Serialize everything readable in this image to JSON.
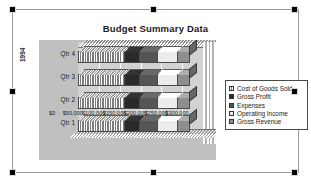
{
  "object": {
    "type": "embedded-chart-object",
    "selected": true,
    "handle_count": 8
  },
  "chart_data": {
    "type": "bar",
    "subtype": "3d-stacked-horizontal-bar",
    "title": "Budget Summary Data",
    "xlabel": "",
    "ylabel": "1994",
    "categories": [
      "Qtr 4",
      "Qtr 3",
      "Qtr 2",
      "Qtr 1"
    ],
    "series": [
      {
        "name": "Cost of Goods Sold",
        "color": "#7d7d7d",
        "pattern": "vertical-stripes",
        "values": [
          112000,
          112000,
          112000,
          112000
        ]
      },
      {
        "name": "Gross Profit",
        "color": "#2a2a2a",
        "pattern": "solid-dark",
        "values": [
          38000,
          38000,
          38000,
          38000
        ]
      },
      {
        "name": "Expenses",
        "color": "#555555",
        "pattern": "solid-medium",
        "values": [
          42000,
          42000,
          42000,
          42000
        ]
      },
      {
        "name": "Operating Income",
        "color": "#ececec",
        "pattern": "solid-light",
        "values": [
          48000,
          48000,
          48000,
          48000
        ]
      },
      {
        "name": "Gross Revenue",
        "color": "#8e8e8e",
        "pattern": "solid-gray",
        "values": [
          30000,
          30000,
          30000,
          30000
        ]
      }
    ],
    "xticks": [
      "$0",
      "$50,000",
      "$100,000",
      "$150,000",
      "$200,000",
      "$250,000",
      "$300,000"
    ],
    "xlim": [
      0,
      300000
    ],
    "grid": true,
    "legend_position": "right",
    "legend_entries": [
      "Cost of Goods Sold",
      "Gross Profit",
      "Expenses",
      "Operating Income",
      "Gross Revenue"
    ],
    "plot_background": "#c0c0c0",
    "wall_background": "#d2d2d2"
  }
}
